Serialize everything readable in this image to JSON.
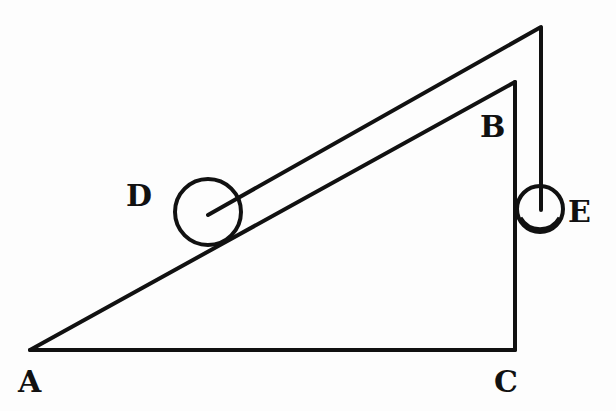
{
  "figure": {
    "type": "geometric-diagram",
    "labels": {
      "A": "A",
      "B": "B",
      "C": "C",
      "D": "D",
      "E": "E"
    },
    "colors": {
      "ink": "#111111",
      "paper": "#fdfdfd"
    }
  }
}
